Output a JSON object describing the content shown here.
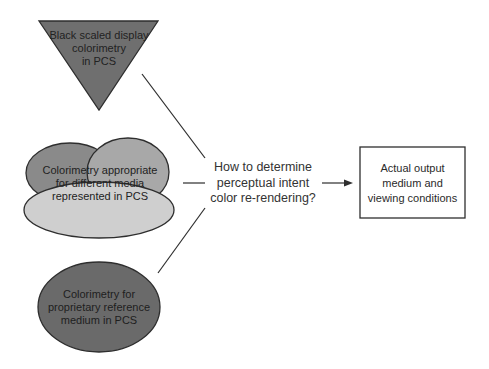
{
  "colors": {
    "triangle_fill": "#6f6f6f",
    "ellipse_dark_fill": "#6a6a6a",
    "cloud_left_fill": "#8a8a8a",
    "cloud_right_fill": "#a8a8a8",
    "cloud_bottom_fill": "#cfcfcf",
    "stroke": "#2e2e2e",
    "background": "#ffffff"
  },
  "nodes": {
    "triangle": {
      "shape": "inverted-triangle",
      "lines": [
        "Black scaled display",
        "colorimetry",
        "in PCS"
      ]
    },
    "cloud": {
      "shape": "cloud-of-ellipses",
      "lines": [
        "Colorimetry appropriate",
        "for different media",
        "represented in PCS"
      ]
    },
    "ellipse": {
      "shape": "ellipse",
      "lines": [
        "Colorimetry for",
        "proprietary reference",
        "medium in PCS"
      ]
    },
    "question": {
      "shape": "text",
      "lines": [
        "How to determine",
        "perceptual intent",
        "color re-rendering?"
      ]
    },
    "output_box": {
      "shape": "rectangle",
      "lines": [
        "Actual output",
        "medium and",
        "viewing conditions"
      ]
    }
  },
  "edges": [
    {
      "from": "triangle",
      "to": "question",
      "style": "line"
    },
    {
      "from": "cloud",
      "to": "question",
      "style": "line"
    },
    {
      "from": "ellipse",
      "to": "question",
      "style": "line"
    },
    {
      "from": "question",
      "to": "output_box",
      "style": "arrow"
    }
  ]
}
